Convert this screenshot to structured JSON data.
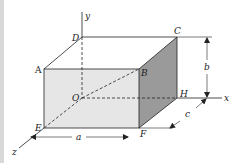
{
  "diagram": {
    "axes": {
      "x": "x",
      "y": "y",
      "z": "z"
    },
    "vertices": {
      "A": "A",
      "B": "B",
      "C": "C",
      "D": "D",
      "E": "E",
      "F": "F",
      "H": "H",
      "O": "O"
    },
    "dimensions": {
      "a": "a",
      "b": "b",
      "c": "c"
    },
    "colors": {
      "front_face": "#e6e6e6",
      "side_face": "#9a9a9a",
      "lines": "#222222",
      "background": "#ffffff"
    }
  }
}
